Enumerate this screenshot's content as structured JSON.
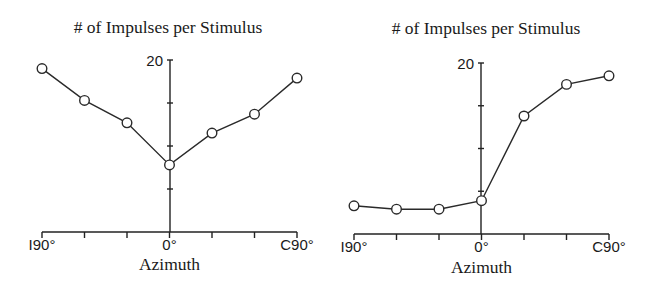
{
  "chart_data": [
    {
      "type": "line",
      "title": "# of Impulses per Stimulus",
      "xlabel": "Azimuth",
      "ylabel": "",
      "x": [
        -90,
        -60,
        -30,
        0,
        30,
        60,
        90
      ],
      "x_tick_labels": [
        {
          "value": -90,
          "label": "I90°"
        },
        {
          "value": 0,
          "label": "0°"
        },
        {
          "value": 90,
          "label": "C90°"
        }
      ],
      "y_tick_labels": [
        {
          "value": 20,
          "label": "20"
        }
      ],
      "y_minor_ticks": [
        5,
        10,
        15,
        20
      ],
      "xlim": [
        -90,
        90
      ],
      "ylim": [
        0,
        20
      ],
      "grid": false,
      "legend": null,
      "series": [
        {
          "name": "Neuron A",
          "values": [
            19.0,
            15.3,
            12.7,
            7.8,
            11.5,
            13.7,
            17.9
          ]
        }
      ],
      "layout": {
        "x0": 42,
        "x1": 297,
        "yaxis_x": 170,
        "y_zero": 232,
        "px_per_unit": 8.6,
        "title_x": 168,
        "title_y": 33,
        "xlabel_y": 270,
        "ticklabel_y": 250
      }
    },
    {
      "type": "line",
      "title": "# of Impulses per Stimulus",
      "xlabel": "Azimuth",
      "ylabel": "",
      "x": [
        -90,
        -60,
        -30,
        0,
        30,
        60,
        90
      ],
      "x_tick_labels": [
        {
          "value": -90,
          "label": "I90°"
        },
        {
          "value": 0,
          "label": "0°"
        },
        {
          "value": 90,
          "label": "C90°"
        }
      ],
      "y_tick_labels": [
        {
          "value": 20,
          "label": "20"
        }
      ],
      "y_minor_ticks": [
        5,
        10,
        15,
        20
      ],
      "xlim": [
        -90,
        90
      ],
      "ylim": [
        0,
        20
      ],
      "grid": false,
      "legend": null,
      "series": [
        {
          "name": "Neuron B",
          "values": [
            3.3,
            2.9,
            2.9,
            3.9,
            13.8,
            17.5,
            18.5
          ]
        }
      ],
      "layout": {
        "x0": 354,
        "x1": 609,
        "yaxis_x": 481,
        "y_zero": 234,
        "px_per_unit": 8.55,
        "title_x": 486,
        "title_y": 34,
        "xlabel_y": 273,
        "ticklabel_y": 252
      }
    }
  ],
  "charts": [
    {
      "title": "# of Impulses per Stimulus",
      "xlabel": "Azimuth",
      "y_max_label": "20",
      "x_labels": [
        "I90°",
        "0°",
        "C90°"
      ]
    },
    {
      "title": "# of Impulses per Stimulus",
      "xlabel": "Azimuth",
      "y_max_label": "20",
      "x_labels": [
        "I90°",
        "0°",
        "C90°"
      ]
    }
  ],
  "style": {
    "line_color": "#2a2a2a",
    "axis_color": "#222222",
    "marker_fill": "#ffffff",
    "background": "#ffffff"
  }
}
